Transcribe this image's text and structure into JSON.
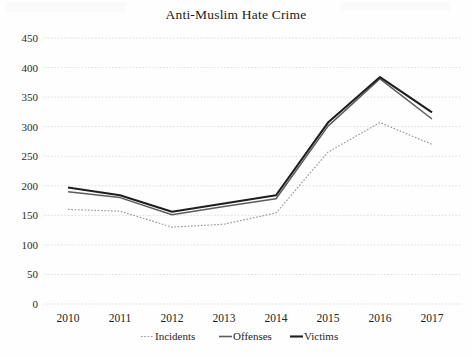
{
  "chart_data": {
    "type": "line",
    "title": "Anti-Muslim Hate Crime",
    "xlabel": "",
    "ylabel": "",
    "categories": [
      "2010",
      "2011",
      "2012",
      "2013",
      "2014",
      "2015",
      "2016",
      "2017"
    ],
    "x": [
      2010,
      2011,
      2012,
      2013,
      2014,
      2015,
      2016,
      2017
    ],
    "ylim": [
      0,
      450
    ],
    "ytick_step": 50,
    "yticks": [
      0,
      50,
      100,
      150,
      200,
      250,
      300,
      350,
      400,
      450
    ],
    "grid": true,
    "legend_position": "bottom",
    "series": [
      {
        "name": "Incidents",
        "style": "dotted",
        "color": "#9a9a9a",
        "values": [
          160,
          157,
          130,
          135,
          154,
          257,
          307,
          270
        ]
      },
      {
        "name": "Offenses",
        "style": "solid",
        "color": "#5c5c5c",
        "values": [
          190,
          180,
          151,
          165,
          178,
          301,
          381,
          313
        ]
      },
      {
        "name": "Victims",
        "style": "solid-bold",
        "color": "#1e1e1e",
        "values": [
          197,
          184,
          156,
          170,
          184,
          307,
          384,
          324
        ]
      }
    ]
  },
  "legend": {
    "items": [
      {
        "label": "Incidents"
      },
      {
        "label": "Offenses"
      },
      {
        "label": "Victims"
      }
    ]
  },
  "colors": {
    "incidents": "#9a9a9a",
    "offenses": "#5c5c5c",
    "victims": "#1e1e1e",
    "gridline": "#c9c9c9",
    "background": "#fefefe",
    "text": "#1c1c1c"
  }
}
